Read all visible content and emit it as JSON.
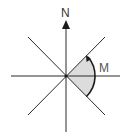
{
  "diagram": {
    "north_label": "N",
    "angle_label": "M",
    "colors": {
      "line": "#2a2a2a",
      "sector_fill": "#dcdcdc",
      "label": "#333333",
      "angle_label": "#555555"
    }
  }
}
